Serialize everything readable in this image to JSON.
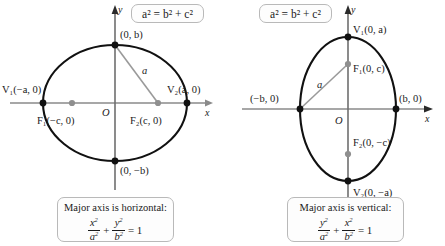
{
  "figure": {
    "caption_kind": "ellipse-standard-forms"
  },
  "panels": [
    {
      "id": "horizontal",
      "pythagorean": "a² = b² + c²",
      "axis_x_label": "x",
      "axis_y_label": "y",
      "origin_label": "O",
      "segment_label": "a",
      "points": [
        {
          "name": "vertex-left",
          "label": "V₁(−a, 0)"
        },
        {
          "name": "vertex-right",
          "label": "V₂(a, 0)"
        },
        {
          "name": "covertex-top",
          "label": "(0, b)"
        },
        {
          "name": "covertex-bottom",
          "label": "(0, −b)"
        },
        {
          "name": "focus-left",
          "label": "F₁(−c, 0)"
        },
        {
          "name": "focus-right",
          "label": "F₂(c, 0)"
        }
      ],
      "summary_title": "Major axis is horizontal:",
      "summary_equation": "x²/a² + y²/b² = 1",
      "equation_parts": {
        "first_num": "x",
        "first_den": "a",
        "plus": "+",
        "second_num": "y",
        "second_den": "b",
        "equals": "= 1"
      }
    },
    {
      "id": "vertical",
      "pythagorean": "a² = b² + c²",
      "axis_x_label": "x",
      "axis_y_label": "y",
      "origin_label": "O",
      "segment_label": "a",
      "points": [
        {
          "name": "vertex-top",
          "label": "V₁(0, a)"
        },
        {
          "name": "vertex-bottom",
          "label": "V₂(0, −a)"
        },
        {
          "name": "covertex-left",
          "label": "(−b, 0)"
        },
        {
          "name": "covertex-right",
          "label": "(b, 0)"
        },
        {
          "name": "focus-top",
          "label": "F₁(0, c)"
        },
        {
          "name": "focus-bottom",
          "label": "F₂(0, −c)"
        }
      ],
      "summary_title": "Major axis is vertical:",
      "summary_equation": "y²/a² + x²/b² = 1",
      "equation_parts": {
        "first_num": "y",
        "first_den": "a",
        "plus": "+",
        "second_num": "x",
        "second_den": "b",
        "equals": "= 1"
      }
    }
  ],
  "colors": {
    "curve": "#111111",
    "axis": "#8a8a8a",
    "vertex_dot": "#111111",
    "focus_dot": "#8f8f8f",
    "segment": "#9a9a9a",
    "box_border": "#b9b9b9",
    "text": "#1a1a1a"
  }
}
